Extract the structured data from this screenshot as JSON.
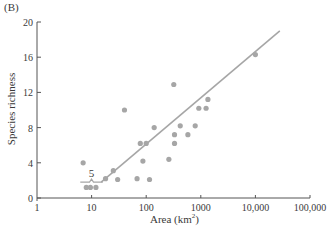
{
  "chart_data": {
    "type": "scatter",
    "panel_label": "(B)",
    "title": "",
    "xlabel": "Area (km²)",
    "xlabel_base": "Area (km",
    "xlabel_sup": "2",
    "xlabel_tail": ")",
    "ylabel": "Species richness",
    "xscale": "log",
    "xlim": [
      1,
      100000
    ],
    "ylim": [
      0,
      20
    ],
    "xticks": [
      1,
      10,
      100,
      1000,
      10000,
      100000
    ],
    "xtick_labels": [
      "1",
      "10",
      "100",
      "1000",
      "10,000",
      "100,000"
    ],
    "yticks": [
      0,
      4,
      8,
      12,
      16,
      20
    ],
    "ytick_labels": [
      "0",
      "4",
      "8",
      "12",
      "16",
      "20"
    ],
    "grid": false,
    "point_color": "#a6a6a6",
    "line_color": "#a6a6a6",
    "points": [
      {
        "x": 7,
        "y": 4.0
      },
      {
        "x": 8,
        "y": 1.2
      },
      {
        "x": 9.5,
        "y": 1.2
      },
      {
        "x": 12,
        "y": 1.2
      },
      {
        "x": 18,
        "y": 2.2
      },
      {
        "x": 25,
        "y": 3.1
      },
      {
        "x": 30,
        "y": 2.1
      },
      {
        "x": 40,
        "y": 10.0
      },
      {
        "x": 68,
        "y": 2.2
      },
      {
        "x": 78,
        "y": 6.2
      },
      {
        "x": 87,
        "y": 4.2
      },
      {
        "x": 100,
        "y": 6.2
      },
      {
        "x": 115,
        "y": 2.1
      },
      {
        "x": 140,
        "y": 8.0
      },
      {
        "x": 260,
        "y": 4.4
      },
      {
        "x": 320,
        "y": 12.9
      },
      {
        "x": 330,
        "y": 7.2
      },
      {
        "x": 330,
        "y": 6.2
      },
      {
        "x": 420,
        "y": 8.2
      },
      {
        "x": 580,
        "y": 7.2
      },
      {
        "x": 790,
        "y": 8.2
      },
      {
        "x": 920,
        "y": 10.2
      },
      {
        "x": 1250,
        "y": 10.2
      },
      {
        "x": 1350,
        "y": 11.2
      },
      {
        "x": 10000,
        "y": 16.3
      }
    ],
    "fit_line": {
      "x0": 15,
      "y0": 1.8,
      "x1": 28000,
      "y1": 19.0
    },
    "annotation": {
      "text": "5",
      "bracket_x": [
        6.2,
        16
      ],
      "bracket_y": 1.8,
      "note": "bracket with 5 marking the small-island threshold"
    }
  }
}
